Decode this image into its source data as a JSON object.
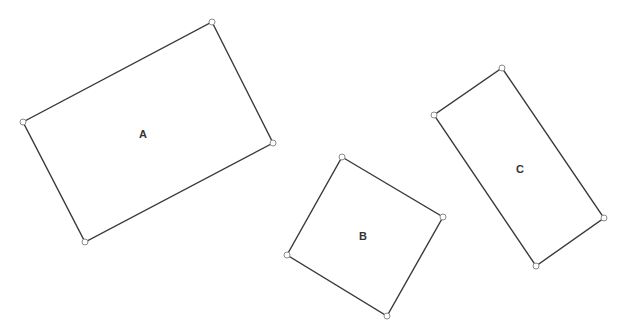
{
  "diagram": {
    "width": 624,
    "height": 335,
    "colors": {
      "edge": "#3a3a3a",
      "vertex_fill": "#ffffff",
      "vertex_stroke": "#8a8a8a",
      "label": "#333333",
      "background": "#ffffff"
    },
    "shapes": [
      {
        "id": "A",
        "label": "A",
        "label_pos": [
          143,
          134
        ],
        "vertices": [
          [
            212,
            22
          ],
          [
            273,
            143
          ],
          [
            85,
            242
          ],
          [
            23,
            122
          ]
        ]
      },
      {
        "id": "B",
        "label": "B",
        "label_pos": [
          363,
          236
        ],
        "vertices": [
          [
            342,
            157
          ],
          [
            443,
            217
          ],
          [
            387,
            316
          ],
          [
            287,
            255
          ]
        ]
      },
      {
        "id": "C",
        "label": "C",
        "label_pos": [
          520,
          169
        ],
        "vertices": [
          [
            502,
            68
          ],
          [
            604,
            218
          ],
          [
            536,
            266
          ],
          [
            434,
            115
          ]
        ]
      }
    ]
  }
}
